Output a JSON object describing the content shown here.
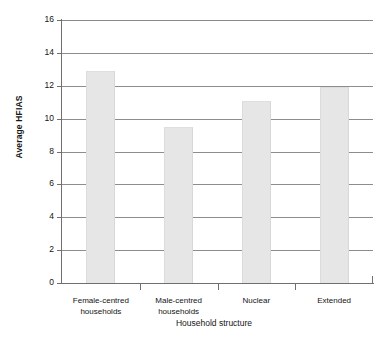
{
  "chart_data": {
    "type": "bar",
    "title": "",
    "subtitle": "",
    "xlabel": "Household structure",
    "ylabel": "Average HFIAS",
    "categories": [
      "Female-centred households",
      "Male-centred households",
      "Nuclear",
      "Extended"
    ],
    "category_lines": [
      [
        "Female-centred",
        "households"
      ],
      [
        "Male-centred",
        "households"
      ],
      [
        "Nuclear",
        ""
      ],
      [
        "Extended",
        ""
      ]
    ],
    "values": [
      12.9,
      9.5,
      11.1,
      11.9
    ],
    "series": [
      {
        "name": "Average HFIAS",
        "values": [
          12.9,
          9.5,
          11.1,
          11.9
        ]
      }
    ],
    "ylim": [
      0,
      16
    ],
    "ytick_step": 2,
    "yticks": [
      0,
      2,
      4,
      6,
      8,
      10,
      12,
      14,
      16
    ],
    "ytick_labels": [
      "0",
      "2",
      "4",
      "6",
      "8",
      "10",
      "12",
      "14",
      "16"
    ],
    "grid": true,
    "grid_axis": "y",
    "legend": false,
    "legend_position": "none",
    "bar_color": "#e6e6e6",
    "axis_color": "#6f6f6f",
    "gridline_color": "#8d8d8d",
    "text_color": "#141414"
  }
}
